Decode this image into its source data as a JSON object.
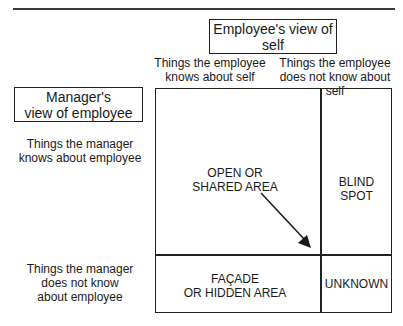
{
  "diagram": {
    "type": "johari-window",
    "employee_header": "Employee's view of self",
    "employee_header_lines": [
      "Employee's view of",
      "self"
    ],
    "manager_header_lines": [
      "Manager's",
      "view of employee"
    ],
    "columns": [
      {
        "lines": [
          "Things the employee",
          "knows about self"
        ]
      },
      {
        "lines": [
          "Things the employee",
          "does not know about self"
        ]
      }
    ],
    "rows": [
      {
        "lines": [
          "Things the manager",
          "knows about employee"
        ]
      },
      {
        "lines": [
          "Things the manager",
          "does not know",
          "about employee"
        ]
      }
    ],
    "cells": {
      "open": [
        "OPEN OR",
        "SHARED AREA"
      ],
      "blind": [
        "BLIND SPOT"
      ],
      "facade": [
        "FAÇADE",
        "OR HIDDEN AREA"
      ],
      "unknown": [
        "UNKNOWN"
      ]
    },
    "arrow": {
      "from": "open",
      "direction": "down-right",
      "meaning": "open area expands"
    },
    "colors": {
      "line": "#222222",
      "text": "#1a1a1a",
      "background": "#ffffff"
    }
  }
}
